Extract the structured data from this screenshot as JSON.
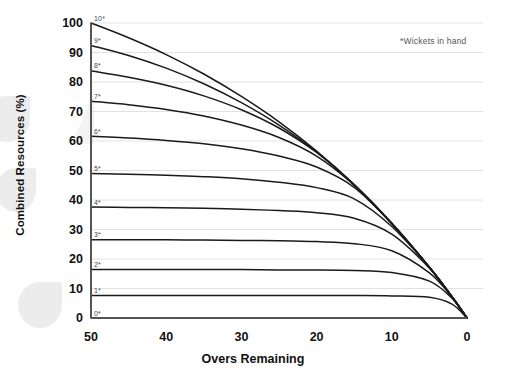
{
  "chart_data": {
    "type": "line",
    "title": "",
    "xlabel": "Overs Remaining",
    "ylabel": "Combined Resources (%)",
    "annotation": "*Wickets in hand",
    "xlim": [
      50,
      0
    ],
    "ylim": [
      0,
      100
    ],
    "x_reversed": true,
    "grid": "horizontal",
    "legend": "inline-curve-labels",
    "xticks": [
      "50",
      "40",
      "30",
      "20",
      "10",
      "0"
    ],
    "xtick_values": [
      50,
      40,
      30,
      20,
      10,
      0
    ],
    "yticks": [
      "0",
      "10",
      "20",
      "30",
      "40",
      "50",
      "60",
      "70",
      "80",
      "90",
      "100"
    ],
    "ytick_values": [
      0,
      10,
      20,
      30,
      40,
      50,
      60,
      70,
      80,
      90,
      100
    ],
    "x": [
      50,
      45,
      40,
      35,
      30,
      25,
      20,
      15,
      10,
      5,
      2,
      0
    ],
    "series": [
      {
        "name": "10*",
        "label": "10*",
        "wickets_in_hand": 10,
        "values": [
          100.0,
          95.0,
          89.3,
          82.7,
          75.1,
          66.5,
          56.6,
          45.2,
          32.1,
          17.2,
          7.2,
          0
        ]
      },
      {
        "name": "9*",
        "label": "9*",
        "wickets_in_hand": 9,
        "values": [
          92.4,
          89.0,
          84.7,
          79.4,
          73.0,
          65.4,
          56.3,
          45.2,
          32.1,
          17.2,
          7.2,
          0
        ]
      },
      {
        "name": "8*",
        "label": "8*",
        "wickets_in_hand": 8,
        "values": [
          83.8,
          81.6,
          78.9,
          75.3,
          70.6,
          64.4,
          56.1,
          45.1,
          32.1,
          17.2,
          7.2,
          0
        ]
      },
      {
        "name": "7*",
        "label": "7*",
        "wickets_in_hand": 7,
        "values": [
          73.5,
          72.3,
          70.7,
          68.5,
          65.4,
          61.2,
          54.9,
          45.0,
          32.0,
          17.2,
          7.2,
          0
        ]
      },
      {
        "name": "6*",
        "label": "6*",
        "wickets_in_hand": 6,
        "values": [
          61.6,
          61.0,
          60.2,
          59.1,
          57.4,
          54.9,
          51.2,
          44.3,
          31.9,
          17.2,
          7.2,
          0
        ]
      },
      {
        "name": "5*",
        "label": "5*",
        "wickets_in_hand": 5,
        "values": [
          49.0,
          48.7,
          48.4,
          47.9,
          47.2,
          46.0,
          44.2,
          40.4,
          31.0,
          17.1,
          7.2,
          0
        ]
      },
      {
        "name": "4*",
        "label": "4*",
        "wickets_in_hand": 4,
        "values": [
          37.6,
          37.5,
          37.4,
          37.2,
          36.9,
          36.4,
          35.7,
          33.8,
          28.4,
          16.9,
          7.2,
          0
        ]
      },
      {
        "name": "3*",
        "label": "3*",
        "wickets_in_hand": 3,
        "values": [
          26.5,
          26.5,
          26.5,
          26.4,
          26.3,
          26.2,
          25.9,
          25.2,
          22.8,
          15.3,
          7.1,
          0
        ]
      },
      {
        "name": "2*",
        "label": "2*",
        "wickets_in_hand": 2,
        "values": [
          16.4,
          16.4,
          16.4,
          16.4,
          16.4,
          16.3,
          16.3,
          16.1,
          15.4,
          12.5,
          6.7,
          0
        ]
      },
      {
        "name": "1*",
        "label": "1*",
        "wickets_in_hand": 1,
        "values": [
          7.6,
          7.6,
          7.6,
          7.6,
          7.6,
          7.6,
          7.6,
          7.6,
          7.5,
          7.0,
          4.7,
          0
        ]
      },
      {
        "name": "0*",
        "label": "0*",
        "wickets_in_hand": 0,
        "values": [
          0,
          0,
          0,
          0,
          0,
          0,
          0,
          0,
          0,
          0,
          0,
          0
        ]
      }
    ]
  },
  "colors": {
    "curve": "#1a1a1a",
    "axis": "#555555",
    "grid": "#e2e2e2",
    "text": "#111111",
    "note": "#555555",
    "watermark": "#e9e9e9"
  }
}
